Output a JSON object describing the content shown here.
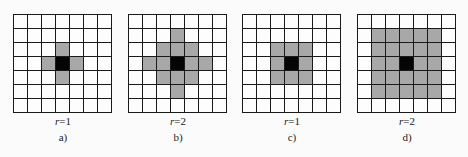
{
  "figure": {
    "grid_size": 7,
    "colors": {
      "empty": "#fdfdfd",
      "neighbor": "#a8a8a8",
      "center": "#050505",
      "line": "#1a1a1a"
    },
    "panels": [
      {
        "id": "a",
        "caption": "a)",
        "r_var": "r",
        "r_eq": "=1",
        "type": "von-neumann",
        "radius": 1
      },
      {
        "id": "b",
        "caption": "b)",
        "r_var": "r",
        "r_eq": "=2",
        "type": "von-neumann",
        "radius": 2
      },
      {
        "id": "c",
        "caption": "c)",
        "r_var": "r",
        "r_eq": "=1",
        "type": "moore",
        "radius": 1
      },
      {
        "id": "d",
        "caption": "d)",
        "r_var": "r",
        "r_eq": "=2",
        "type": "moore",
        "radius": 2
      }
    ]
  }
}
